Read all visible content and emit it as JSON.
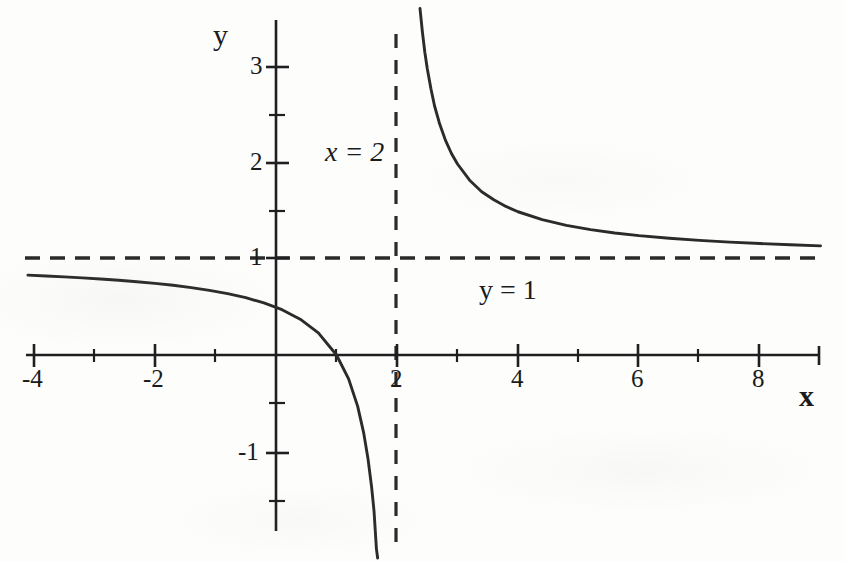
{
  "chart_data": {
    "type": "line",
    "title": "",
    "subtitle": "",
    "xlabel": "x",
    "ylabel": "y",
    "xlim": [
      -4.1,
      9.0
    ],
    "ylim": [
      -1.5,
      3.5
    ],
    "grid": false,
    "legend_position": "none",
    "function": "y = (x - 1) / (x - 2) = 1 + 1/(x - 2)",
    "x_ticks": [
      -4,
      -2,
      2,
      4,
      6,
      8
    ],
    "x_tick_labels": [
      "-4",
      "-2",
      "2",
      "4",
      "6",
      "8"
    ],
    "x_minor_ticks": [
      -3,
      -1,
      1,
      3,
      5,
      7,
      9
    ],
    "y_ticks": [
      -1,
      1,
      2,
      3
    ],
    "y_tick_labels": [
      "-1",
      "1",
      "2",
      "3"
    ],
    "y_minor_ticks": [
      -1.5,
      -0.5,
      1.5,
      2.5
    ],
    "annotations": [
      {
        "text": "x = 2",
        "x": 1.2,
        "y": 2.2,
        "style": "italic",
        "meaning": "vertical-asymptote-label"
      },
      {
        "text": "y = 1",
        "x": 3.6,
        "y": 0.75,
        "style": "upright",
        "meaning": "horizontal-asymptote-label"
      }
    ],
    "asymptotes": [
      {
        "kind": "vertical",
        "value": 2,
        "dash": true,
        "label": "x = 2"
      },
      {
        "kind": "horizontal",
        "value": 1,
        "dash": true,
        "label": "y = 1"
      }
    ],
    "series": [
      {
        "name": "left-branch",
        "domain": [
          -4.1,
          1.68
        ],
        "points_x": [
          -4.1,
          -3.8,
          -3.5,
          -3.2,
          -2.9,
          -2.6,
          -2.3,
          -2.0,
          -1.7,
          -1.4,
          -1.1,
          -0.8,
          -0.5,
          -0.2,
          0.1,
          0.4,
          0.7,
          1.0,
          1.2,
          1.35,
          1.45,
          1.52,
          1.58,
          1.62,
          1.66,
          1.68
        ],
        "points_y": [
          0.836,
          0.828,
          0.818,
          0.808,
          0.796,
          0.783,
          0.767,
          0.75,
          0.73,
          0.706,
          0.677,
          0.643,
          0.6,
          0.545,
          0.474,
          0.375,
          0.231,
          0.0,
          -0.25,
          -0.538,
          -0.818,
          -1.083,
          -1.381,
          -1.632,
          -2.03,
          -2.125
        ]
      },
      {
        "name": "right-branch",
        "domain": [
          2.38,
          9.0
        ],
        "points_x": [
          2.38,
          2.42,
          2.46,
          2.5,
          2.56,
          2.62,
          2.7,
          2.8,
          2.9,
          3.0,
          3.2,
          3.4,
          3.6,
          3.8,
          4.0,
          4.4,
          4.8,
          5.2,
          5.6,
          6.0,
          6.5,
          7.0,
          7.5,
          8.0,
          8.5,
          9.0
        ],
        "points_y": [
          3.63,
          3.38,
          3.17,
          3.0,
          2.79,
          2.61,
          2.43,
          2.25,
          2.11,
          2.0,
          1.83,
          1.71,
          1.625,
          1.556,
          1.5,
          1.417,
          1.357,
          1.3125,
          1.278,
          1.25,
          1.222,
          1.2,
          1.182,
          1.167,
          1.154,
          1.143
        ]
      }
    ],
    "key_points": [
      {
        "label": "x-intercept",
        "x": 1,
        "y": 0
      },
      {
        "label": "y-intercept",
        "x": 0,
        "y": 0.5
      }
    ]
  },
  "axes": {
    "x_axis_label": "x",
    "y_axis_label": "y",
    "x_tick_labels": [
      "-4",
      "-2",
      "2",
      "4",
      "6",
      "8"
    ],
    "y_tick_labels": [
      "3",
      "2",
      "1",
      "-1"
    ]
  },
  "annotations": {
    "vertical_asymptote": "x = 2",
    "horizontal_asymptote": "y = 1"
  },
  "colors": {
    "curve": "#2b2b2b",
    "axis": "#1f1f1f",
    "dashed": "#2a2a2a",
    "text": "#1b1b1b",
    "background": "#fdfdfc"
  }
}
